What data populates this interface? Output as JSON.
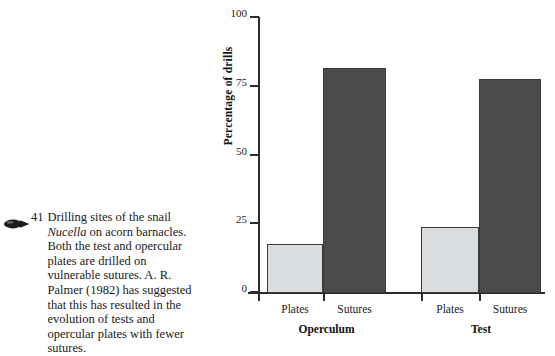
{
  "caption": {
    "marker_icon": "pointer-oval-icon",
    "number": "41",
    "text_part1": "Drilling sites of the snail ",
    "species": "Nucella",
    "text_part2": " on acorn barnacles. Both the test and opercular plates are drilled on vulnerable sutures. A. R. Palmer (1982) has suggested that this has resulted in the evolution of tests and opercular plates with fewer sutures."
  },
  "colors": {
    "light_bar": "#d9dde0",
    "dark_bar": "#4b4b4b",
    "axis": "#2b2b2b",
    "bar_outline": "#3a3a3a"
  },
  "chart_data": {
    "type": "bar",
    "title": "",
    "xlabel": "",
    "ylabel": "Percentage of drills",
    "ylim": [
      0,
      100
    ],
    "yticks": [
      0,
      25,
      50,
      75,
      100
    ],
    "ytick_labels": [
      "0",
      "25",
      "50",
      "75",
      "100"
    ],
    "grid": false,
    "legend": "none",
    "groups": [
      "Operculum",
      "Test"
    ],
    "categories": [
      "Plates",
      "Sutures",
      "Plates",
      "Sutures"
    ],
    "values": [
      18,
      82,
      24,
      78
    ],
    "bars": [
      {
        "group": "Operculum",
        "category": "Plates",
        "value": 18,
        "shade": "light"
      },
      {
        "group": "Operculum",
        "category": "Sutures",
        "value": 82,
        "shade": "dark"
      },
      {
        "group": "Test",
        "category": "Plates",
        "value": 24,
        "shade": "light"
      },
      {
        "group": "Test",
        "category": "Sutures",
        "value": 78,
        "shade": "dark"
      }
    ]
  }
}
